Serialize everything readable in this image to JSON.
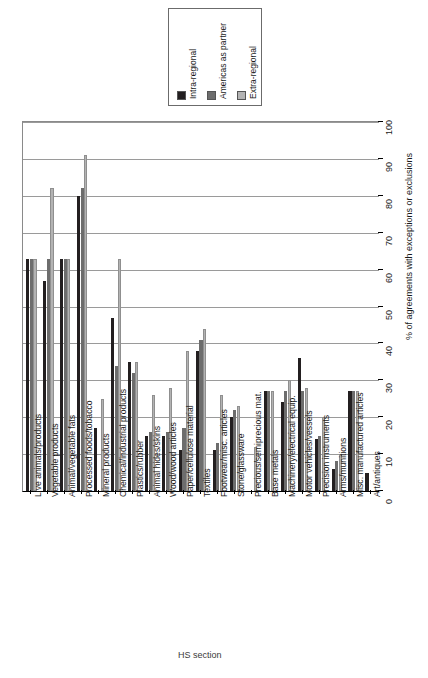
{
  "chart_data": {
    "type": "bar",
    "orientation": "horizontal-rotated",
    "title": "",
    "xlabel": "HS section",
    "ylabel": "% of agreements with exceptions or exclusions",
    "ylim": [
      0,
      100
    ],
    "yticks": [
      0,
      10,
      20,
      30,
      40,
      50,
      60,
      70,
      80,
      90,
      100
    ],
    "grid": true,
    "legend_position": "top",
    "categories": [
      "Live animals/products",
      "Vegetable products",
      "Animal/vegetable fats",
      "Processed foods/tobacco",
      "Mineral products",
      "Chemical/industrial products",
      "Plastics/rubber",
      "Animal hides/skins",
      "Wood/wood articles",
      "Paper/cellulose material",
      "Textiles",
      "Footwear/misc. articles",
      "Stone/glassware",
      "Precious/semiprecious mat.",
      "Base metals",
      "Machinery/electrical equip.",
      "Motor vehicles/vessels",
      "Precision instruments",
      "Arms/munitions",
      "Misc. manufactured articles",
      "Art/antiques"
    ],
    "series": [
      {
        "name": "Intra-regional",
        "color": "#231f20",
        "values": [
          63,
          57,
          63,
          80,
          17,
          47,
          35,
          15,
          15,
          11,
          38,
          11,
          20,
          0,
          27,
          24,
          36,
          14,
          6,
          27,
          5
        ]
      },
      {
        "name": "Americas as partner",
        "color": "#6d6d6d",
        "values": [
          63,
          63,
          63,
          82,
          0,
          34,
          32,
          16,
          16,
          17,
          41,
          13,
          22,
          0,
          27,
          27,
          27,
          15,
          8,
          27,
          0
        ]
      },
      {
        "name": "Extra-regional",
        "color": "#b3b3b3",
        "values": [
          63,
          82,
          63,
          91,
          25,
          63,
          35,
          26,
          28,
          38,
          44,
          26,
          23,
          12,
          27,
          30,
          28,
          20,
          10,
          27,
          0
        ]
      }
    ]
  },
  "legend": {
    "items": [
      {
        "label": "Intra-regional",
        "color": "#231f20"
      },
      {
        "label": "Americas as partner",
        "color": "#6d6d6d"
      },
      {
        "label": "Extra-regional",
        "color": "#b3b3b3"
      }
    ]
  },
  "axes": {
    "value_axis_title": "% of agreements with exceptions or exclusions",
    "category_axis_title": "HS section"
  }
}
